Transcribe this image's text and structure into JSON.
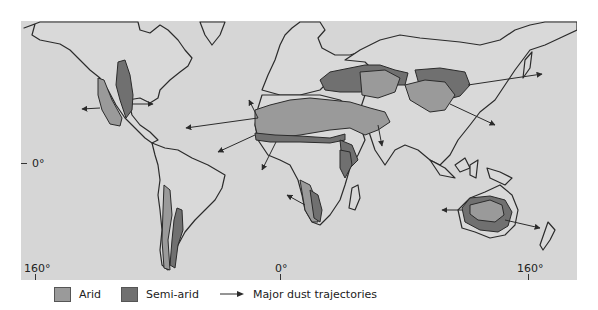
{
  "map": {
    "title": "",
    "colors": {
      "ocean": "#d6d6d6",
      "land": "#d9d9d9",
      "arid": "#9a9a9a",
      "semi_arid": "#707070",
      "outline": "#2b2b2b"
    },
    "axes": {
      "longitude_ticks": [
        {
          "label": "160°",
          "x": 35
        },
        {
          "label": "0°",
          "x": 280
        },
        {
          "label": "160°",
          "x": 528
        }
      ],
      "latitude_ticks": [
        {
          "label": "0°",
          "y": 164
        }
      ]
    }
  },
  "legend": {
    "items": [
      {
        "label": "Arid",
        "color": "#9a9a9a"
      },
      {
        "label": "Semi-arid",
        "color": "#707070"
      },
      {
        "label": "Major dust trajectories",
        "symbol": "arrow-icon"
      }
    ]
  }
}
